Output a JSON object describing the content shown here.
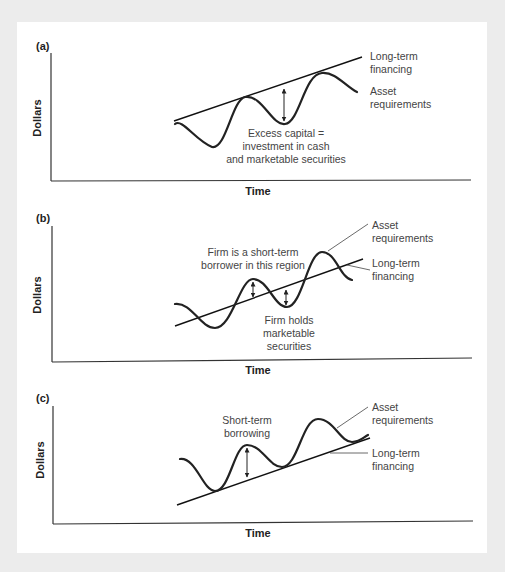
{
  "figure": {
    "background_color": "#ececec",
    "panel_color": "#ffffff",
    "line_color": "#222222"
  },
  "panels": [
    {
      "id": "a",
      "label": "(a)",
      "ylabel": "Dollars",
      "xlabel": "Time",
      "annotations": {
        "long_term_1": "Long-term",
        "long_term_2": "financing",
        "asset_1": "Asset",
        "asset_2": "requirements",
        "note_1": "Excess capital =",
        "note_2": "investment in cash",
        "note_3": "and marketable securities"
      }
    },
    {
      "id": "b",
      "label": "(b)",
      "ylabel": "Dollars",
      "xlabel": "Time",
      "annotations": {
        "asset_1": "Asset",
        "asset_2": "requirements",
        "long_term_1": "Long-term",
        "long_term_2": "financing",
        "borrower_1": "Firm is a short-term",
        "borrower_2": "borrower in this region",
        "holds_1": "Firm holds",
        "holds_2": "marketable",
        "holds_3": "securities"
      }
    },
    {
      "id": "c",
      "label": "(c)",
      "ylabel": "Dollars",
      "xlabel": "Time",
      "annotations": {
        "asset_1": "Asset",
        "asset_2": "requirements",
        "long_term_1": "Long-term",
        "long_term_2": "financing",
        "borrow_1": "Short-term",
        "borrow_2": "borrowing"
      }
    }
  ]
}
